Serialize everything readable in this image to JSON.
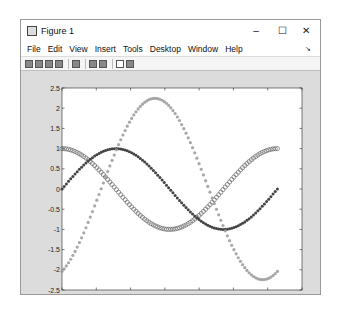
{
  "window": {
    "title": "Figure 1",
    "controls": {
      "minimize": "–",
      "maximize": "☐",
      "close": "✕"
    }
  },
  "menubar": {
    "items": [
      "File",
      "Edit",
      "View",
      "Insert",
      "Tools",
      "Desktop",
      "Window",
      "Help"
    ],
    "dock_glyph": "↘"
  },
  "toolbar": {
    "buttons": [
      "new-figure",
      "open-file",
      "save",
      "print",
      "print-preview",
      "link-plot",
      "insert-colorbar",
      "edit-plot",
      "open-property-inspector"
    ]
  },
  "chart_data": {
    "type": "line",
    "title": "",
    "xlabel": "",
    "ylabel": "",
    "xlim": [
      0,
      7
    ],
    "ylim": [
      -2.5,
      2.5
    ],
    "xticks": [
      0,
      1,
      2,
      3,
      4,
      5,
      6,
      7
    ],
    "yticks": [
      -2.5,
      -2,
      -1.5,
      -1,
      -0.5,
      0,
      0.5,
      1,
      1.5,
      2,
      2.5
    ],
    "xtick_labels": [
      "0",
      "1",
      "2",
      "3",
      "4",
      "5",
      "6",
      "7"
    ],
    "ytick_labels": [
      "-2.5",
      "-2",
      "-1.5",
      "-1",
      "-0.5",
      "0",
      "0.5",
      "1",
      "1.5",
      "2",
      "2.5"
    ],
    "grid": false,
    "legend": null,
    "x_range": [
      0,
      6.2832
    ],
    "num_points": 100,
    "series": [
      {
        "name": "cos(x)",
        "marker": "o",
        "color": "#555555",
        "formula": "cos(x)",
        "sample_x": [
          0,
          1,
          2,
          3,
          3.14,
          4,
          5,
          6,
          6.28
        ],
        "sample_y": [
          1,
          0.54,
          -0.42,
          -0.99,
          -1,
          -0.65,
          0.28,
          0.96,
          1
        ]
      },
      {
        "name": "sin(x)",
        "marker": ".",
        "color": "#444444",
        "formula": "sin(x)",
        "sample_x": [
          0,
          1,
          1.57,
          2,
          3,
          4,
          4.71,
          5,
          6,
          6.28
        ],
        "sample_y": [
          0,
          0.84,
          1,
          0.91,
          0.14,
          -0.76,
          -1,
          -0.96,
          -0.28,
          0
        ]
      },
      {
        "name": "curve3",
        "marker": "*",
        "color": "#999999",
        "sample_x": [
          0,
          1,
          2,
          2.7,
          3,
          4,
          5,
          5.8,
          6.28
        ],
        "sample_y": [
          -2,
          -0.5,
          1.6,
          2.25,
          2.1,
          0.2,
          -1.6,
          -2.1,
          -1.85
        ]
      }
    ]
  }
}
